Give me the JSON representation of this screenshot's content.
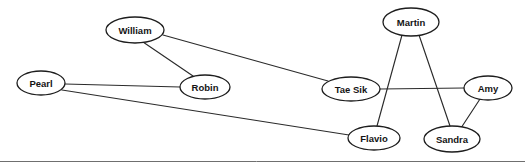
{
  "diagram": {
    "type": "node-link-graph",
    "width": 525,
    "height": 162,
    "background_color": "#ffffff",
    "node_fill_color": "#ffffff",
    "node_stroke_color": "#1d1d1d",
    "edge_color": "#2b2b2b",
    "label_color": "#141414",
    "border": {
      "visible": true,
      "color": "#6f6f6f",
      "edges": "bottom"
    },
    "nodes": [
      {
        "id": "pearl",
        "label": "Pearl",
        "cx": 41,
        "cy": 83,
        "rx": 24,
        "ry": 12
      },
      {
        "id": "william",
        "label": "William",
        "cx": 135,
        "cy": 30,
        "rx": 29,
        "ry": 13
      },
      {
        "id": "robin",
        "label": "Robin",
        "cx": 205,
        "cy": 87,
        "rx": 25,
        "ry": 12
      },
      {
        "id": "taesik",
        "label": "Tae Sik",
        "cx": 351,
        "cy": 89,
        "rx": 29,
        "ry": 12
      },
      {
        "id": "martin",
        "label": "Martin",
        "cx": 411,
        "cy": 22,
        "rx": 28,
        "ry": 14
      },
      {
        "id": "amy",
        "label": "Amy",
        "cx": 488,
        "cy": 88,
        "rx": 24,
        "ry": 12
      },
      {
        "id": "flavio",
        "label": "Flavio",
        "cx": 374,
        "cy": 138,
        "rx": 26,
        "ry": 12
      },
      {
        "id": "sandra",
        "label": "Sandra",
        "cx": 452,
        "cy": 139,
        "rx": 28,
        "ry": 13
      }
    ],
    "edges": [
      {
        "id": "pearl-robin",
        "source": "pearl",
        "target": "robin",
        "x1": 65,
        "y1": 84,
        "x2": 180,
        "y2": 87
      },
      {
        "id": "pearl-flavio",
        "source": "pearl",
        "target": "flavio",
        "x1": 62,
        "y1": 90,
        "x2": 349,
        "y2": 135
      },
      {
        "id": "william-robin",
        "source": "william",
        "target": "robin",
        "x1": 143,
        "y1": 42,
        "x2": 193,
        "y2": 76
      },
      {
        "id": "william-taesik",
        "source": "william",
        "target": "taesik",
        "x1": 163,
        "y1": 35,
        "x2": 328,
        "y2": 81
      },
      {
        "id": "taesik-amy",
        "source": "taesik",
        "target": "amy",
        "x1": 380,
        "y1": 89,
        "x2": 464,
        "y2": 88
      },
      {
        "id": "martin-flavio",
        "source": "martin",
        "target": "flavio",
        "x1": 402,
        "y1": 35,
        "x2": 377,
        "y2": 126
      },
      {
        "id": "martin-sandra",
        "source": "martin",
        "target": "sandra",
        "x1": 419,
        "y1": 35,
        "x2": 450,
        "y2": 126
      },
      {
        "id": "amy-sandra",
        "source": "amy",
        "target": "sandra",
        "x1": 480,
        "y1": 99,
        "x2": 461,
        "y2": 128
      }
    ]
  }
}
